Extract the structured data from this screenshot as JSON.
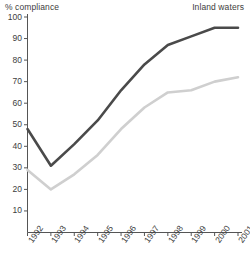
{
  "header": {
    "y_axis_title": "% compliance",
    "series_title": "Inland waters"
  },
  "chart_data": {
    "type": "line",
    "title": "",
    "subtitle": "",
    "xlabel": "",
    "ylabel": "% compliance",
    "annotations": [
      "Inland waters"
    ],
    "grid": false,
    "legend": "none",
    "x": [
      "1992",
      "1993",
      "1994",
      "1995",
      "1996",
      "1997",
      "1998",
      "1999",
      "2000",
      "2001"
    ],
    "categories": [
      "1992",
      "1993",
      "1994",
      "1995",
      "1996",
      "1997",
      "1998",
      "1999",
      "2000",
      "2001"
    ],
    "xlim": [
      "1992",
      "2001"
    ],
    "ylim": [
      0,
      100
    ],
    "yticks": [
      10,
      20,
      30,
      40,
      50,
      60,
      70,
      80,
      90,
      100
    ],
    "ytick_labels": [
      "10",
      "20",
      "30",
      "40",
      "50",
      "60",
      "70",
      "80",
      "90",
      "100"
    ],
    "series": [
      {
        "name": "dark-series",
        "color": "#4a4a4a",
        "values": [
          48,
          31,
          41,
          52,
          66,
          78,
          87,
          91,
          95,
          95
        ]
      },
      {
        "name": "light-series",
        "color": "#cfcfcf",
        "values": [
          29,
          20,
          27,
          36,
          48,
          58,
          65,
          66,
          70,
          72
        ]
      }
    ]
  },
  "axis": {
    "line_color": "#555555",
    "tick_color": "#555555"
  }
}
